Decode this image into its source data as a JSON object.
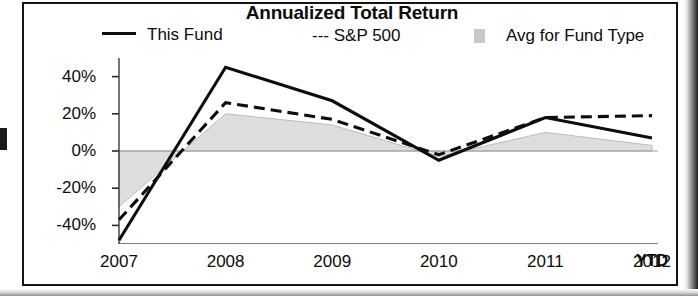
{
  "chart_data": {
    "type": "line",
    "title": "Annualized Total Return",
    "xlabel": "",
    "ylabel": "",
    "categories": [
      "2007",
      "2008",
      "2009",
      "2010",
      "2011",
      "2012"
    ],
    "x_axis_suffix": "YTD",
    "ylim": [
      -50,
      50
    ],
    "ytick_labels": [
      "40%",
      "20%",
      "0%",
      "-20%",
      "-40%"
    ],
    "ytick_values": [
      40,
      20,
      0,
      -20,
      -40
    ],
    "grid": false,
    "zero_line": true,
    "legend_position": "top",
    "series": [
      {
        "name": "This Fund",
        "style": "solid",
        "color": "#0d0d0d",
        "values": [
          -48,
          45,
          27,
          -5,
          18,
          7
        ]
      },
      {
        "name": "S&P 500",
        "style": "dashed",
        "color": "#0d0d0d",
        "values": [
          -37,
          26,
          17,
          -2,
          18,
          19
        ]
      },
      {
        "name": "Avg for Fund Type",
        "style": "area",
        "color": "#c9c9c9",
        "values": [
          -30,
          20,
          14,
          -3,
          10,
          3
        ]
      }
    ]
  },
  "legend": {
    "this_fund": "This Fund",
    "sp500": "--- S&P 500",
    "avg_fund_type": "Avg for Fund Type"
  }
}
